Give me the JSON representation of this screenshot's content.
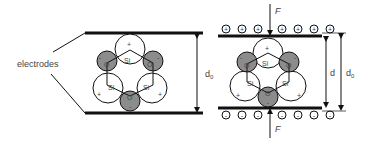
{
  "diagram": {
    "colors": {
      "line": "#111111",
      "oxygen_fill": "#8c8c8c",
      "silicon_fill": "#ffffff",
      "text": "#444444"
    },
    "left_panel": {
      "label": "electrodes",
      "distance_label": "d",
      "distance_sub": "0",
      "atoms": {
        "silicon": "Si",
        "oxygen": "O",
        "plus": "+",
        "minus": "-"
      }
    },
    "right_panel": {
      "force_top": "F",
      "force_bottom": "F",
      "compressed_label": "d",
      "original_label": "d",
      "original_sub": "0",
      "top_charges": [
        "+",
        "+",
        "+",
        "+",
        "+",
        "+",
        "+"
      ],
      "bottom_charges": [
        "-",
        "-",
        "-",
        "-",
        "-",
        "-",
        "-"
      ],
      "atoms": {
        "silicon": "Si",
        "oxygen": "O",
        "plus": "+",
        "minus": "-"
      }
    }
  }
}
